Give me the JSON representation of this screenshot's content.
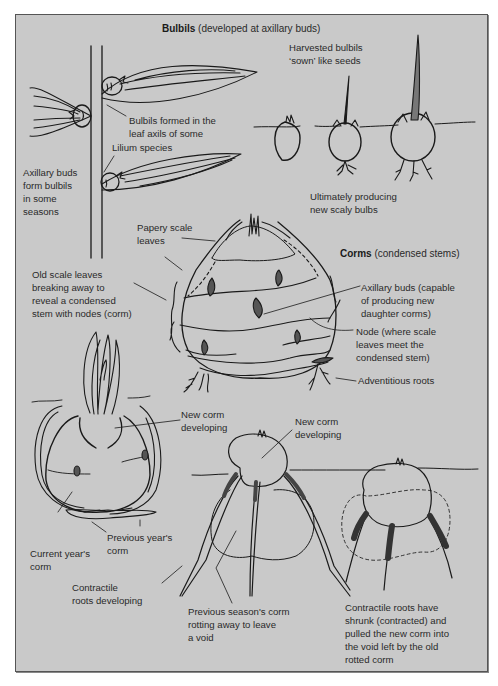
{
  "figure": {
    "background_color": "#c9c9c9",
    "border_color": "#555555",
    "line_color": "#1a1a1a",
    "bud_fill": "#555555"
  },
  "bulbils": {
    "heading_bold": "Bulbils",
    "heading_rest": " (developed at axillary buds)",
    "axillary_label": "Axillary buds\nform bulbils\nin some\nseasons",
    "leaf_axil_label": "Bulbils formed in the\nleaf axils of some",
    "lilium_label": "Lilium species",
    "harvested_label": "Harvested bulbils\n‘sown’ like seeds",
    "ultimately_label": "Ultimately producing\nnew scaly bulbs"
  },
  "corms": {
    "heading_bold": "Corms",
    "heading_rest": " (condensed stems)",
    "papery_label": "Papery scale\nleaves",
    "old_scale_label": "Old scale leaves\nbreaking away to\nreveal a condensed\nstem with nodes (corm)",
    "axillary_label": "Axillary buds (capable\nof producing new\ndaughter corms)",
    "node_label": "Node (where scale\nleaves meet the\ncondensed stem)",
    "adventitious_label": "Adventitious roots"
  },
  "development": {
    "new_corm_left_label": "New corm\ndeveloping",
    "previous_year_label": "Previous year's\ncorm",
    "current_year_label": "Current year's\ncorm",
    "contractile_developing_label": "Contractile\nroots developing",
    "new_corm_mid_label": "New corm\ndeveloping",
    "previous_season_label": "Previous season's corm\nrotting away to leave\na void",
    "contractile_shrunk_label": "Contractile roots have\nshrunk (contracted) and\npulled the new corm into\nthe void left by the old\nrotted corm"
  }
}
